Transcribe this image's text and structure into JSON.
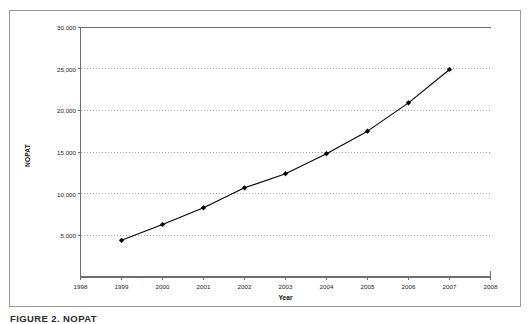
{
  "figure": {
    "caption": "FIGURE 2. NOPAT",
    "frame_color": "#9a9a9a",
    "background": "#ffffff"
  },
  "chart_data": {
    "type": "line",
    "title": "",
    "subtitle": "",
    "xlabel": "Year",
    "ylabel": "NOPAT",
    "x": [
      1999,
      2000,
      2001,
      2002,
      2003,
      2004,
      2005,
      2006,
      2007
    ],
    "values": [
      4400,
      6300,
      8300,
      10700,
      12400,
      14800,
      17500,
      20900,
      24900
    ],
    "series": [
      {
        "name": "NOPAT",
        "x": [
          1999,
          2000,
          2001,
          2002,
          2003,
          2004,
          2005,
          2006,
          2007
        ],
        "values": [
          4400,
          6300,
          8300,
          10700,
          12400,
          14800,
          17500,
          20900,
          24900
        ],
        "line_color": "#000000",
        "marker": "diamond",
        "marker_color": "#000000"
      }
    ],
    "xlim": [
      1998,
      2008
    ],
    "ylim": [
      0,
      30000
    ],
    "xticks": [
      1998,
      1999,
      2000,
      2001,
      2002,
      2003,
      2004,
      2005,
      2006,
      2007,
      2008
    ],
    "xtick_labels": [
      "1998",
      "1999",
      "2000",
      "2001",
      "2002",
      "2003",
      "2004",
      "2005",
      "2006",
      "2007",
      "2008"
    ],
    "yticks": [
      5000,
      10000,
      15000,
      20000,
      25000,
      30000
    ],
    "ytick_labels": [
      "5,000",
      "10,000",
      "15,000",
      "20,000",
      "25,000",
      "30,000"
    ],
    "grid": {
      "horizontal": true,
      "vertical": false,
      "style": "dotted",
      "color": "#8c8c8c"
    },
    "legend": {
      "visible": false,
      "position": "none"
    },
    "plot_border": {
      "left": true,
      "bottom": true,
      "top": false,
      "right": false,
      "color": "#6e6e6e"
    }
  }
}
